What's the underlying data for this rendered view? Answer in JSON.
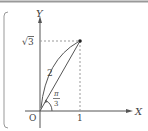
{
  "diagram": {
    "axis_x_label": "X",
    "axis_y_label": "Y",
    "origin_label": "O",
    "x_tick_label": "1",
    "y_tick_label": "3",
    "y_tick_radical": "√",
    "segment_length_label": "2",
    "angle_numerator": "π",
    "angle_denominator": "3",
    "point": {
      "x": "1",
      "y": "√3"
    },
    "colors": {
      "line": "#555555",
      "dashed": "#999999",
      "frame": "#888888"
    }
  }
}
